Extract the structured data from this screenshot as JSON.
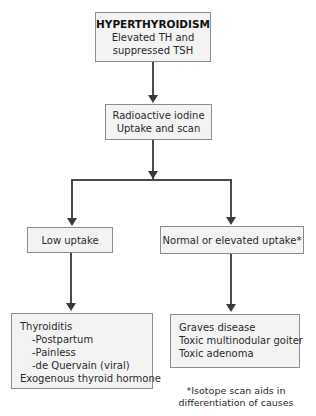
{
  "nodes": {
    "root": {
      "title": "HYPERTHYROIDISM",
      "lines": [
        "Elevated TH and",
        "suppressed TSH"
      ]
    },
    "test": {
      "lines": [
        "Radioactive iodine",
        "Uptake and scan"
      ]
    },
    "low_uptake": {
      "label": "Low uptake"
    },
    "normal_uptake": {
      "label": "Normal or elevated uptake*"
    },
    "low_causes": {
      "items": [
        {
          "text": "Thyroiditis",
          "indent": false
        },
        {
          "text": "-Postpartum",
          "indent": true
        },
        {
          "text": "-Painless",
          "indent": true
        },
        {
          "text": "-de Quervain (viral)",
          "indent": true
        },
        {
          "text": "Exogenous thyroid hormone",
          "indent": false
        }
      ]
    },
    "normal_causes": {
      "items": [
        {
          "text": "Graves disease"
        },
        {
          "text": "Toxic multinodular goiter"
        },
        {
          "text": "Toxic adenoma"
        }
      ]
    }
  },
  "footnote": {
    "lines": [
      "*Isotope scan aids in",
      "differentiation of causes"
    ]
  },
  "edges": [
    {
      "from": "root",
      "to": "test"
    },
    {
      "from": "test",
      "to": "low_uptake"
    },
    {
      "from": "test",
      "to": "normal_uptake"
    },
    {
      "from": "low_uptake",
      "to": "low_causes"
    },
    {
      "from": "normal_uptake",
      "to": "normal_causes"
    }
  ],
  "colors": {
    "box_fill": "#f3f3f3",
    "box_border": "#8c8c8c",
    "connector": "#4a4a4a"
  }
}
